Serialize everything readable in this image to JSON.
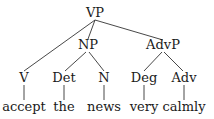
{
  "tree": {
    "root": {
      "label": "VP"
    },
    "phrases": {
      "np": {
        "label": "NP"
      },
      "advp": {
        "label": "AdvP"
      }
    },
    "categories": [
      {
        "label": "V"
      },
      {
        "label": "Det"
      },
      {
        "label": "N"
      },
      {
        "label": "Deg"
      },
      {
        "label": "Adv"
      }
    ],
    "words": [
      {
        "label": "accept"
      },
      {
        "label": "the"
      },
      {
        "label": "news"
      },
      {
        "label": "very"
      },
      {
        "label": "calmly"
      }
    ]
  },
  "colors": {
    "line": "#333333",
    "text": "#1a1a1a"
  }
}
